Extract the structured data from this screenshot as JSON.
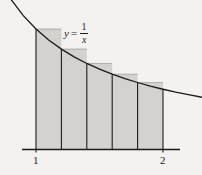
{
  "figure": {
    "background_color": "#f4f2ef",
    "ink_color": "#1b1b1b",
    "shade_fill_color": "#d3d2cf",
    "curve_label": {
      "variable": "y",
      "equals": "=",
      "numerator": "1",
      "denominator": "x",
      "full_text": "y = 1/x"
    },
    "axis": {
      "tick_labels": [
        {
          "text": "1",
          "value": 1
        },
        {
          "text": "2",
          "value": 2
        }
      ]
    }
  },
  "chart_data": {
    "type": "area",
    "title": "",
    "subtitle": "",
    "xlabel": "",
    "ylabel": "",
    "annotations": [
      {
        "text": "y = 1/x",
        "x": 1.25,
        "y": 0.82,
        "kind": "curve-label"
      }
    ],
    "grid": false,
    "legend": null,
    "xlim": [
      0.72,
      2.32
    ],
    "ylim": [
      0,
      1.38
    ],
    "xticks": [
      1,
      2
    ],
    "xticklabels": [
      "1",
      "2"
    ],
    "yticks": [],
    "yticklabels": [],
    "function": "y = 1/x",
    "curve": {
      "name": "y = 1/x",
      "x": [
        0.72,
        0.8,
        0.9,
        1.0,
        1.1,
        1.2,
        1.3,
        1.4,
        1.5,
        1.6,
        1.7,
        1.8,
        1.9,
        2.0,
        2.1,
        2.2,
        2.32
      ],
      "y": [
        1.389,
        1.25,
        1.111,
        1.0,
        0.909,
        0.833,
        0.769,
        0.714,
        0.667,
        0.625,
        0.588,
        0.556,
        0.526,
        0.5,
        0.476,
        0.455,
        0.431
      ]
    },
    "rectangles": {
      "description": "Five left-endpoint inscribed rectangles under y = 1/x on [1, 2]",
      "count": 5,
      "interval": [
        1,
        2
      ],
      "width": 0.2,
      "edges": [
        1.0,
        1.2,
        1.4,
        1.6,
        1.8,
        2.0
      ],
      "heights": [
        1.0,
        0.8333,
        0.7143,
        0.625,
        0.5556
      ],
      "rule": "left-endpoint"
    }
  }
}
